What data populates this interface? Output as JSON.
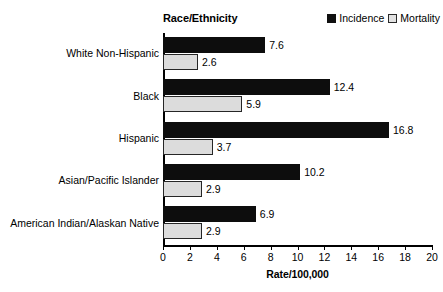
{
  "chart_data": {
    "type": "bar",
    "orientation": "horizontal",
    "title": "Race/Ethnicity",
    "xlabel": "Rate/100,000",
    "ylabel": "Race/Ethnicity",
    "xlim": [
      0,
      20
    ],
    "xticks": [
      0,
      2,
      4,
      6,
      8,
      10,
      12,
      14,
      16,
      18,
      20
    ],
    "grid": false,
    "legend_position": "top-right",
    "categories": [
      "White Non-Hispanic",
      "Black",
      "Hispanic",
      "Asian/Pacific Islander",
      "American Indian/Alaskan Native"
    ],
    "series": [
      {
        "name": "Incidence",
        "color": "#0d0d0d",
        "values": [
          7.6,
          12.4,
          16.8,
          10.2,
          6.9
        ],
        "labels": [
          "7.6",
          "12.4",
          "16.8",
          "10.2",
          "6.9"
        ]
      },
      {
        "name": "Mortality",
        "color": "#dcdcdc",
        "values": [
          2.6,
          5.9,
          3.7,
          2.9,
          2.9
        ],
        "labels": [
          "2.6",
          "5.9",
          "3.7",
          "2.9",
          "2.9"
        ]
      }
    ]
  },
  "legend": {
    "items": [
      {
        "label": "Incidence",
        "swatch": "filled-square-icon"
      },
      {
        "label": "Mortality",
        "swatch": "open-square-icon"
      }
    ]
  },
  "axis": {
    "x_title": "Rate/100,000",
    "tick_labels": [
      "0",
      "2",
      "4",
      "6",
      "8",
      "10",
      "12",
      "14",
      "16",
      "18",
      "20"
    ]
  }
}
